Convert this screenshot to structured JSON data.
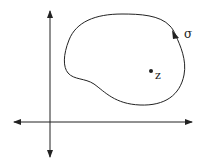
{
  "diagram": {
    "type": "complex-plane contour",
    "curve_label": "σ",
    "point_label": "z",
    "colors": {
      "stroke": "#222222",
      "background": "#ffffff"
    },
    "axes": {
      "horizontal": "bidirectional arrow",
      "vertical": "bidirectional arrow"
    },
    "curve_orientation": "counterclockwise arrow"
  }
}
